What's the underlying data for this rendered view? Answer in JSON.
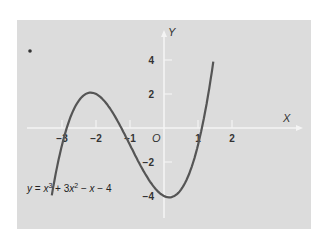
{
  "chart_data": {
    "type": "line",
    "title": "",
    "equation": "y = x³ + 3x² − x − 4",
    "xlabel": "X",
    "ylabel": "Y",
    "origin_label": "O",
    "xlim": [
      -4.2,
      3.5
    ],
    "ylim": [
      -5.1,
      5.4
    ],
    "x_ticks": [
      -3,
      -2,
      -1,
      1,
      2
    ],
    "x_tick_labels": [
      "−3",
      "−2",
      "−1",
      "1",
      "2"
    ],
    "y_ticks": [
      4,
      2,
      -2,
      -4
    ],
    "y_tick_labels": [
      "4",
      "2",
      "−2",
      "−4"
    ],
    "grid": false,
    "series": [
      {
        "name": "y = x^3 + 3x^2 - x - 4",
        "x_range": [
          -3.3,
          1.45
        ],
        "points": [
          [
            -3.3,
            -3.97
          ],
          [
            -3.0,
            -1.0
          ],
          [
            -2.8,
            0.96
          ],
          [
            -2.5,
            1.63
          ],
          [
            -2.2,
            1.96
          ],
          [
            -2.15,
            1.97
          ],
          [
            -2.0,
            2.0
          ],
          [
            -1.5,
            0.88
          ],
          [
            -1.0,
            -1.0
          ],
          [
            -0.5,
            -2.88
          ],
          [
            0.0,
            -4.0
          ],
          [
            0.15,
            -4.08
          ],
          [
            0.5,
            -3.63
          ],
          [
            1.0,
            -1.0
          ],
          [
            1.45,
            3.9
          ]
        ],
        "color": "#555555"
      }
    ],
    "annotations": [
      {
        "text": "y = x³ + 3x² − x − 4",
        "x": -3.9,
        "y": -3.1
      }
    ]
  },
  "colors": {
    "panel": "#dcdcdc",
    "axis": "#f4f4f4",
    "curve": "#555555",
    "text": "#333333"
  }
}
